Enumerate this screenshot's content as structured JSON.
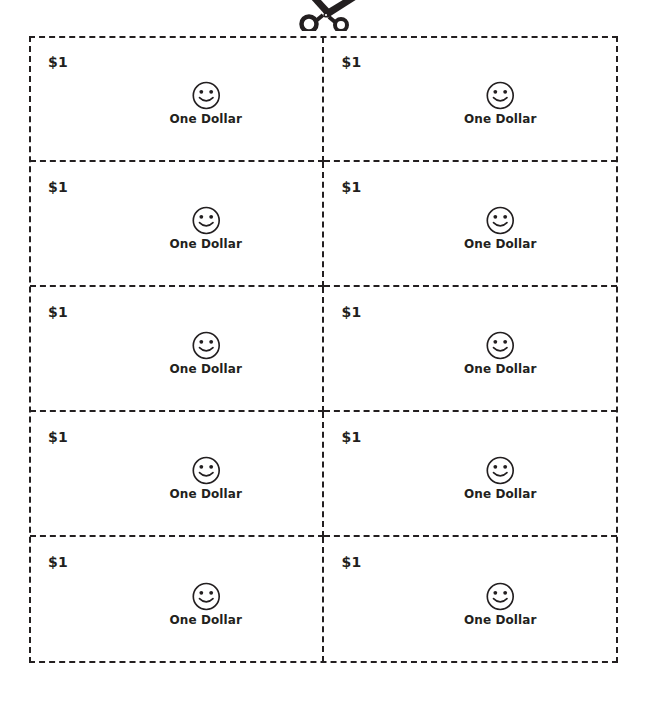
{
  "page": {
    "background_color": "#ffffff",
    "ink_color": "#231f20",
    "cut_marker_icon": "scissors-icon"
  },
  "sheet": {
    "columns": 2,
    "rows": 5,
    "border_style": "dashed",
    "coupons": [
      {
        "denomination": "$1",
        "label": "One Dollar",
        "face_icon": "smiley-face-icon"
      },
      {
        "denomination": "$1",
        "label": "One Dollar",
        "face_icon": "smiley-face-icon"
      },
      {
        "denomination": "$1",
        "label": "One Dollar",
        "face_icon": "smiley-face-icon"
      },
      {
        "denomination": "$1",
        "label": "One Dollar",
        "face_icon": "smiley-face-icon"
      },
      {
        "denomination": "$1",
        "label": "One Dollar",
        "face_icon": "smiley-face-icon"
      },
      {
        "denomination": "$1",
        "label": "One Dollar",
        "face_icon": "smiley-face-icon"
      },
      {
        "denomination": "$1",
        "label": "One Dollar",
        "face_icon": "smiley-face-icon"
      },
      {
        "denomination": "$1",
        "label": "One Dollar",
        "face_icon": "smiley-face-icon"
      },
      {
        "denomination": "$1",
        "label": "One Dollar",
        "face_icon": "smiley-face-icon"
      },
      {
        "denomination": "$1",
        "label": "One Dollar",
        "face_icon": "smiley-face-icon"
      }
    ]
  }
}
